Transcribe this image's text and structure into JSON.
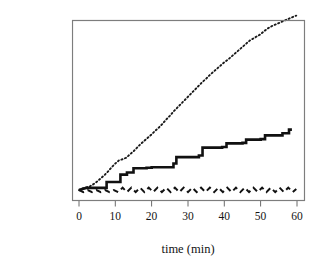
{
  "figure": {
    "title": "",
    "background_color": "#ffffff",
    "axis_color": "#6b6b6b",
    "text_color": "#141414"
  },
  "axes": {
    "xlabel": "time (min)",
    "ylabel": "No. arrivals",
    "xticks": [
      "0",
      "10",
      "20",
      "30",
      "40",
      "50",
      "60"
    ],
    "yticks": [
      "0",
      "10",
      "20",
      "30",
      "40",
      "50",
      "60"
    ]
  },
  "chart_data": {
    "type": "line",
    "title": "",
    "xlabel": "time (min)",
    "ylabel": "No. arrivals",
    "xlim": [
      0,
      60
    ],
    "ylim": [
      -1,
      66
    ],
    "xticks": [
      0,
      10,
      20,
      30,
      40,
      50,
      60
    ],
    "yticks": [
      0,
      10,
      20,
      30,
      40,
      50,
      60
    ],
    "grid": false,
    "legend": "none",
    "series": [
      {
        "name": "cumulative arrivals (high rate)",
        "style": "dotted",
        "color": "#1a1a1a",
        "shape": "step-like rising, nearly linear",
        "x": [
          0.0,
          1.0,
          2.0,
          3.0,
          4.0,
          5.0,
          6.0,
          7.0,
          8.0,
          9.0,
          10.0,
          11.0,
          12.0,
          13.0,
          14.0,
          15.0,
          16.0,
          17.0,
          18.0,
          19.0,
          20.0,
          21.0,
          22.0,
          23.0,
          24.0,
          25.0,
          26.0,
          27.0,
          28.0,
          29.0,
          30.0,
          31.0,
          32.0,
          33.0,
          34.0,
          35.0,
          36.0,
          37.0,
          38.0,
          39.0,
          40.0,
          41.0,
          42.0,
          43.0,
          44.0,
          45.0,
          46.0,
          47.0,
          48.0,
          49.0,
          50.0,
          51.0,
          52.0,
          53.0,
          54.0,
          55.0,
          56.0,
          57.0,
          58.0,
          59.0,
          59.8
        ],
        "y": [
          0.0,
          0.6,
          1.0,
          1.4,
          2.2,
          3.2,
          4.4,
          5.6,
          7.0,
          8.6,
          10.0,
          11.2,
          11.6,
          12.2,
          13.4,
          14.6,
          16.0,
          17.4,
          18.6,
          19.8,
          21.0,
          22.4,
          23.6,
          25.0,
          26.6,
          28.0,
          29.6,
          31.0,
          32.4,
          33.8,
          35.2,
          36.6,
          38.0,
          39.4,
          40.8,
          42.0,
          43.4,
          44.6,
          45.8,
          47.0,
          48.2,
          49.2,
          50.4,
          51.6,
          52.8,
          54.0,
          55.2,
          56.4,
          57.2,
          58.0,
          58.8,
          60.0,
          61.0,
          61.8,
          62.4,
          63.0,
          63.6,
          64.2,
          64.8,
          65.4,
          65.8
        ]
      },
      {
        "name": "cumulative arrivals (low rate)",
        "style": "solid-step",
        "color": "#111111",
        "shape": "monotone step function",
        "steps_x": [
          0.0,
          2.0,
          4.6,
          7.6,
          7.6,
          9.5,
          11.4,
          11.4,
          13.2,
          13.2,
          15.0,
          15.0,
          18.6,
          18.6,
          20.0,
          20.0,
          26.0,
          26.0,
          26.8,
          26.8,
          33.0,
          33.0,
          34.0,
          34.0,
          39.4,
          39.4,
          40.6,
          40.6,
          45.0,
          45.0,
          46.0,
          46.0,
          50.0,
          50.0,
          51.2,
          51.2,
          56.0,
          56.0,
          57.8,
          57.8,
          58.6
        ],
        "steps_y": [
          0.0,
          0.8,
          0.8,
          0.8,
          3.0,
          3.0,
          3.0,
          5.8,
          5.8,
          6.6,
          6.6,
          8.2,
          8.2,
          8.4,
          8.4,
          8.6,
          8.6,
          10.0,
          10.0,
          12.4,
          12.4,
          13.0,
          13.0,
          16.0,
          16.0,
          16.2,
          16.2,
          17.6,
          17.6,
          17.8,
          17.8,
          19.0,
          19.0,
          19.2,
          19.2,
          20.6,
          20.6,
          21.4,
          21.4,
          22.8,
          22.8
        ],
        "final_value": 23
      },
      {
        "name": "queue length",
        "style": "dashed",
        "color": "#111111",
        "shape": "sawtooth oscillating about zero",
        "x": [
          0.0,
          1.2,
          2.4,
          3.6,
          4.8,
          6.0,
          7.2,
          8.4,
          9.6,
          10.8,
          12.0,
          13.2,
          14.4,
          15.6,
          16.8,
          18.0,
          19.2,
          20.4,
          21.6,
          22.8,
          24.0,
          25.2,
          26.4,
          27.6,
          28.8,
          30.0,
          31.2,
          32.4,
          33.6,
          34.8,
          36.0,
          37.2,
          38.4,
          39.6,
          40.8,
          42.0,
          43.2,
          44.4,
          45.6,
          46.8,
          48.0,
          49.2,
          50.4,
          51.6,
          52.8,
          54.0,
          55.2,
          56.4,
          57.6,
          58.8,
          59.8
        ],
        "y": [
          0.0,
          -0.8,
          0.0,
          -0.8,
          0.0,
          -0.8,
          0.0,
          -0.8,
          0.0,
          -0.8,
          0.9,
          -0.8,
          0.9,
          -0.8,
          0.9,
          -0.8,
          0.9,
          -0.8,
          0.9,
          -0.8,
          0.9,
          -0.8,
          0.9,
          -0.8,
          0.9,
          -0.8,
          0.9,
          -0.8,
          0.9,
          -0.8,
          0.9,
          -0.8,
          0.9,
          -0.8,
          0.9,
          -0.8,
          0.9,
          -0.8,
          0.9,
          -0.8,
          0.9,
          -0.8,
          0.9,
          -0.8,
          0.9,
          -0.8,
          0.9,
          -0.8,
          0.9,
          -0.8,
          0.4
        ]
      }
    ]
  }
}
